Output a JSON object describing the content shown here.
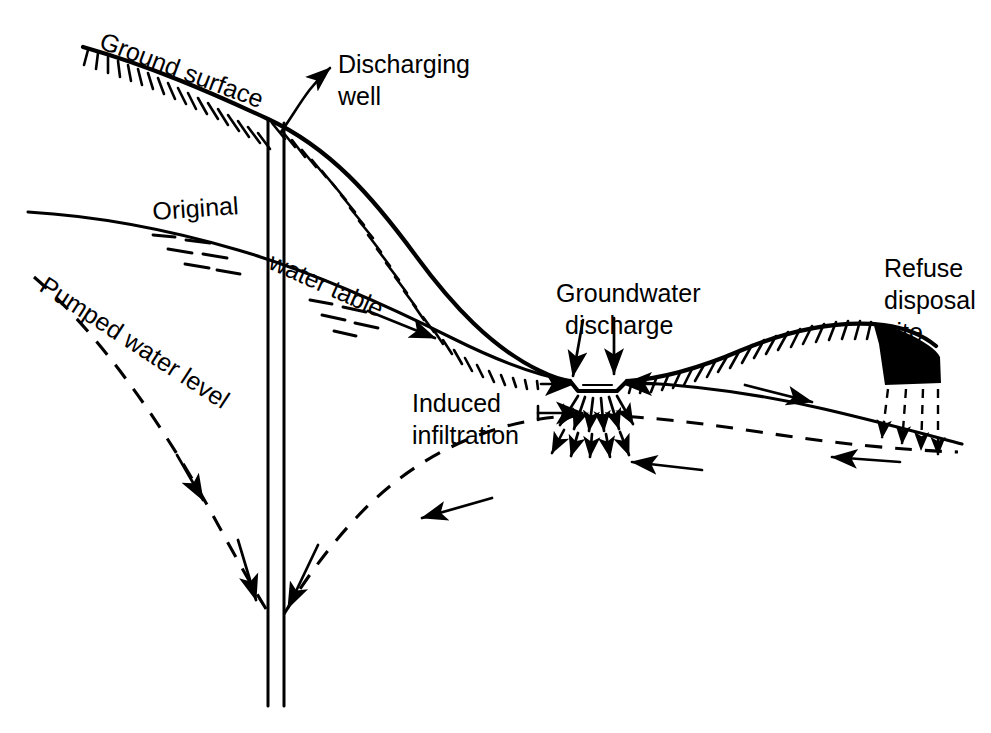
{
  "figure": {
    "kind": "hydrogeologic-cross-section",
    "background_color": "#ffffff",
    "ink_color": "#000000",
    "width": 991,
    "height": 733
  },
  "labels": {
    "ground_surface": "Ground surface",
    "discharging_well_line1": "Discharging",
    "discharging_well_line2": "well",
    "original": "Original",
    "water_table": "water table",
    "pumped_water_level": "Pumped water level",
    "groundwater_discharge_line1": "Groundwater",
    "groundwater_discharge_line2": "discharge",
    "induced_infiltration_line1": "Induced",
    "induced_infiltration_line2": "infiltration",
    "refuse_site_line1": "Refuse",
    "refuse_site_line2": "disposal",
    "refuse_site_line3": "site"
  },
  "icons": {
    "ground_surface": "hachured-terrain-icon",
    "well": "well-casing-icon",
    "water_table": "water-table-icon",
    "cone_of_depression": "dashed-drawdown-curve-icon",
    "stream": "stream-channel-icon",
    "refuse": "filled-refuse-wedge-icon",
    "leachate": "dashed-downward-arrow-icon",
    "flow": "flow-arrow-icon"
  },
  "features": [
    {
      "name": "ground-surface",
      "type": "line",
      "style": "solid-hachured"
    },
    {
      "name": "discharging-well",
      "type": "double-vertical-line"
    },
    {
      "name": "original-water-table",
      "type": "line",
      "style": "solid"
    },
    {
      "name": "pumped-water-level",
      "type": "curve",
      "style": "dashed"
    },
    {
      "name": "stream-channel",
      "type": "trapezoid"
    },
    {
      "name": "refuse-disposal-site",
      "type": "filled-wedge"
    },
    {
      "name": "induced-infiltration-arrows",
      "type": "arrow-fan"
    },
    {
      "name": "groundwater-discharge-arrows",
      "type": "arrow-pair"
    },
    {
      "name": "leachate-arrows",
      "type": "dashed-arrows"
    }
  ]
}
